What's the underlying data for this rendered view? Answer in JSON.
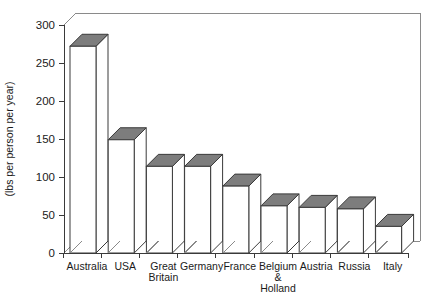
{
  "chart_data": {
    "type": "bar",
    "title": "",
    "subtitle": "",
    "xlabel": "",
    "ylabel": "(lbs per person per year)",
    "ylim": [
      0,
      300
    ],
    "yticks": [
      0,
      50,
      100,
      150,
      200,
      250,
      300
    ],
    "ytick_labels": [
      "0",
      "50",
      "100",
      "150",
      "200",
      "250",
      "300"
    ],
    "grid": false,
    "legend": false,
    "legend_position": "none",
    "style": "3d-bar",
    "bar_top_color": "#7d7d7d",
    "bar_front_color": "#ffffff",
    "bar_edge_color": "#3a3a3a",
    "categories": [
      "Australia",
      "Great Britain",
      "Germany",
      "France",
      "Belgium & Holland",
      "Austria",
      "Russia",
      "Italy",
      "USA"
    ],
    "x": [
      "Australia",
      "USA",
      "Great Britain",
      "Germany",
      "France",
      "Belgium & Holland",
      "Austria",
      "Russia",
      "Italy"
    ],
    "values": [
      272,
      149,
      114,
      114,
      88,
      62,
      60,
      58,
      35
    ],
    "points": [
      {
        "label": "Australia",
        "lines": [
          "Australia"
        ],
        "value": 272
      },
      {
        "label": "USA",
        "lines": [
          "USA"
        ],
        "value": 149
      },
      {
        "label": "Great Britain",
        "lines": [
          "Great",
          "Britain"
        ],
        "value": 114
      },
      {
        "label": "Germany",
        "lines": [
          "Germany"
        ],
        "value": 114
      },
      {
        "label": "France",
        "lines": [
          "France"
        ],
        "value": 88
      },
      {
        "label": "Belgium & Holland",
        "lines": [
          "Belgium",
          "&",
          "Holland"
        ],
        "value": 62
      },
      {
        "label": "Austria",
        "lines": [
          "Austria"
        ],
        "value": 60
      },
      {
        "label": "Russia",
        "lines": [
          "Russia"
        ],
        "value": 58
      },
      {
        "label": "Italy",
        "lines": [
          "Italy"
        ],
        "value": 35
      }
    ]
  },
  "axis": {
    "y_label": "(lbs per person per year)",
    "y_ticks": [
      "300",
      "250",
      "200",
      "150",
      "100",
      "50",
      "0"
    ]
  }
}
